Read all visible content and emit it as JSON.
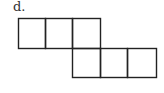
{
  "figure": {
    "label": "d.",
    "stroke_color": "#222222",
    "background": "#ffffff",
    "squares": [
      {
        "row": 0,
        "col": 0
      },
      {
        "row": 0,
        "col": 1
      },
      {
        "row": 0,
        "col": 2
      },
      {
        "row": 1,
        "col": 2
      },
      {
        "row": 1,
        "col": 3
      },
      {
        "row": 1,
        "col": 4
      }
    ]
  }
}
